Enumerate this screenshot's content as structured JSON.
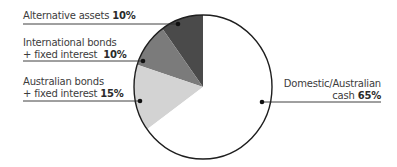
{
  "chart_data": {
    "type": "pie",
    "title": "",
    "start_angle_deg": 0,
    "direction": "counterclockwise",
    "slices": [
      {
        "name": "Alternative assets",
        "value": 10,
        "color": "#4a4a4a"
      },
      {
        "name": "International bonds + fixed interest",
        "value": 10,
        "color": "#7b7b7b"
      },
      {
        "name": "Australian bonds + fixed interest",
        "value": 15,
        "color": "#d3d3d3"
      },
      {
        "name": "Domestic/Australian cash",
        "value": 65,
        "color": "#ffffff"
      }
    ],
    "legend": "callout-labels"
  },
  "labels": {
    "alternative": {
      "line1": "Alternative assets",
      "pct": "10%"
    },
    "international": {
      "line1": "International bonds",
      "line2": "+ fixed interest",
      "pct": "10%"
    },
    "australian": {
      "line1": "Australian bonds",
      "line2": "+ fixed interest",
      "pct": "15%"
    },
    "domestic": {
      "line1": "Domestic/Australian",
      "line2": "cash",
      "pct": "65%"
    }
  },
  "style": {
    "outline": "#1e1e1e",
    "leader": "#2a2a2a"
  }
}
